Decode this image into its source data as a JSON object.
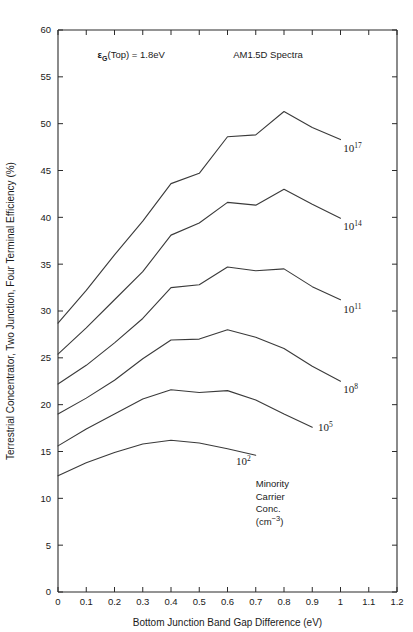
{
  "chart_data": {
    "type": "line",
    "title": "",
    "xlabel": "Bottom Junction Band Gap Difference (eV)",
    "ylabel": "Terrestrial Concentrator, Two Junction, Four Terminal Efficiency (%)",
    "xlim": [
      0,
      1.2
    ],
    "ylim": [
      0,
      60
    ],
    "xticks": [
      "0",
      "0.1",
      "0.2",
      "0.3",
      "0.4",
      "0.5",
      "0.6",
      "0.7",
      "0.8",
      "0.9",
      "1",
      "1.1",
      "1.2"
    ],
    "xtick_values": [
      0,
      0.1,
      0.2,
      0.3,
      0.4,
      0.5,
      0.6,
      0.7,
      0.8,
      0.9,
      1.0,
      1.1,
      1.2
    ],
    "yticks": [
      "0",
      "5",
      "10",
      "15",
      "20",
      "25",
      "30",
      "35",
      "40",
      "45",
      "50",
      "55",
      "60"
    ],
    "ytick_values": [
      0,
      5,
      10,
      15,
      20,
      25,
      30,
      35,
      40,
      45,
      50,
      55,
      60
    ],
    "grid": false,
    "legend_position": "inline-right-of-curve-ends",
    "annotations": [
      {
        "name": "top-gap-annotation",
        "text_parts": [
          "ε",
          "G",
          "(Top) = 1.8eV"
        ],
        "text": "εG(Top) = 1.8eV",
        "x": 0.14,
        "y": 57.0
      },
      {
        "name": "spectra-annotation",
        "text": "AM1.5D Spectra",
        "x": 0.62,
        "y": 57.0
      }
    ],
    "legend_block": {
      "lines": [
        "Minority",
        "Carrier",
        "Conc.",
        "(cm−3)"
      ],
      "line4_base": "(cm",
      "line4_exp": "−3",
      "line4_tail": ")"
    },
    "series": [
      {
        "name": "10^17",
        "label_base": "10",
        "label_exp": "17",
        "label_x": 1.01,
        "label_y": 47.0,
        "x": [
          0,
          0.1,
          0.2,
          0.3,
          0.4,
          0.5,
          0.6,
          0.7,
          0.8,
          0.9,
          1.0
        ],
        "y": [
          28.7,
          32.2,
          36.0,
          39.6,
          43.6,
          44.7,
          48.6,
          48.8,
          51.3,
          49.6,
          48.3
        ]
      },
      {
        "name": "10^14",
        "label_base": "10",
        "label_exp": "14",
        "label_x": 1.01,
        "label_y": 38.6,
        "x": [
          0,
          0.1,
          0.2,
          0.3,
          0.4,
          0.5,
          0.6,
          0.7,
          0.8,
          0.9,
          1.0
        ],
        "y": [
          25.4,
          28.2,
          31.2,
          34.2,
          38.1,
          39.4,
          41.6,
          41.3,
          43.0,
          41.4,
          39.9
        ]
      },
      {
        "name": "10^11",
        "label_base": "10",
        "label_exp": "11",
        "label_x": 1.01,
        "label_y": 29.8,
        "x": [
          0,
          0.1,
          0.2,
          0.3,
          0.4,
          0.5,
          0.6,
          0.7,
          0.8,
          0.9,
          1.0
        ],
        "y": [
          22.2,
          24.2,
          26.6,
          29.2,
          32.5,
          32.8,
          34.7,
          34.3,
          34.5,
          32.6,
          31.2
        ]
      },
      {
        "name": "10^8",
        "label_base": "10",
        "label_exp": "8",
        "label_x": 1.01,
        "label_y": 21.2,
        "x": [
          0,
          0.1,
          0.2,
          0.3,
          0.4,
          0.5,
          0.6,
          0.7,
          0.8,
          0.9,
          1.0
        ],
        "y": [
          19.0,
          20.7,
          22.6,
          24.9,
          26.9,
          27.0,
          28.0,
          27.2,
          26.0,
          24.1,
          22.5
        ]
      },
      {
        "name": "10^5",
        "label_base": "10",
        "label_exp": "5",
        "label_x": 0.92,
        "label_y": 17.2,
        "x": [
          0,
          0.1,
          0.2,
          0.3,
          0.4,
          0.5,
          0.6,
          0.7,
          0.8,
          0.9
        ],
        "y": [
          15.6,
          17.4,
          19.0,
          20.6,
          21.6,
          21.3,
          21.5,
          20.5,
          19.0,
          17.6
        ]
      },
      {
        "name": "10^2",
        "label_base": "10",
        "label_exp": "2",
        "label_x": 0.63,
        "label_y": 13.6,
        "x": [
          0,
          0.1,
          0.2,
          0.3,
          0.4,
          0.5,
          0.6,
          0.7
        ],
        "y": [
          12.4,
          13.8,
          14.9,
          15.8,
          16.2,
          15.9,
          15.3,
          14.6
        ]
      }
    ]
  }
}
